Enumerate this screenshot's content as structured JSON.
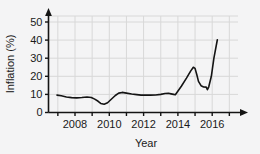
{
  "chart_data": {
    "type": "line",
    "title": "",
    "xlabel": "Year",
    "ylabel": "Inflation (%)",
    "xlim": [
      2006.8,
      2017.4
    ],
    "ylim": [
      0,
      57
    ],
    "grid": true,
    "legend": null,
    "y_ticks": [
      0,
      10,
      20,
      30,
      40,
      50
    ],
    "y_tick_labels": [
      "0",
      "10",
      "20",
      "30",
      "40",
      "50"
    ],
    "x_ticks": [
      2007,
      2008,
      2009,
      2010,
      2011,
      2012,
      2013,
      2014,
      2015,
      2016,
      2017
    ],
    "x_tick_labels": [
      "",
      "2008",
      "",
      "2010",
      "",
      "2012",
      "",
      "2014",
      "",
      "2016",
      ""
    ],
    "x_labeled_ticks": [
      2008,
      2010,
      2012,
      2014,
      2016
    ],
    "line_color": "#141414",
    "grid_color": "#d8d8d8",
    "axis_color": "#141414",
    "series": [
      {
        "name": "Inflation",
        "x": [
          2006.95,
          2007.2,
          2007.5,
          2007.8,
          2008.1,
          2008.4,
          2008.7,
          2008.95,
          2009.15,
          2009.35,
          2009.5,
          2009.7,
          2009.9,
          2010.1,
          2010.35,
          2010.55,
          2010.75,
          2011.0,
          2011.3,
          2011.6,
          2011.85,
          2012.1,
          2012.4,
          2012.7,
          2013.0,
          2013.25,
          2013.45,
          2013.6,
          2013.75,
          2013.85,
          2014.2,
          2014.5,
          2014.75,
          2014.9,
          2015.0,
          2015.1,
          2015.2,
          2015.35,
          2015.5,
          2015.65,
          2015.72,
          2015.8,
          2015.95,
          2016.1,
          2016.3
        ],
        "y": [
          9.6,
          9.3,
          8.6,
          8.2,
          8.1,
          8.3,
          8.6,
          8.3,
          7.4,
          6.2,
          5.0,
          4.6,
          5.4,
          7.2,
          9.4,
          10.7,
          11.1,
          10.7,
          10.2,
          9.9,
          9.6,
          9.7,
          9.6,
          9.7,
          10.0,
          10.5,
          10.6,
          10.3,
          10.0,
          9.8,
          14.5,
          19.0,
          23.0,
          25.0,
          24.4,
          21.0,
          17.2,
          14.8,
          14.1,
          14.0,
          12.6,
          14.2,
          20.0,
          30.0,
          40.2
        ]
      }
    ]
  }
}
